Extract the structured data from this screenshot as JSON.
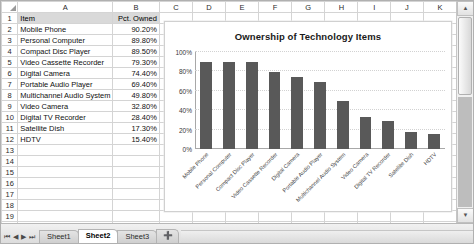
{
  "spreadsheet": {
    "column_headers": [
      "A",
      "B",
      "C",
      "D",
      "E",
      "F",
      "G",
      "H",
      "I",
      "J",
      "K"
    ],
    "row_numbers": [
      "1",
      "2",
      "3",
      "4",
      "5",
      "6",
      "7",
      "8",
      "9",
      "10",
      "11",
      "12",
      "13",
      "14",
      "15",
      "16",
      "17",
      "18",
      "19",
      "20"
    ],
    "header_row": {
      "item": "Item",
      "pct": "Pct. Owned"
    },
    "rows": [
      {
        "item": "Mobile Phone",
        "pct": "90.20%"
      },
      {
        "item": "Personal Computer",
        "pct": "89.80%"
      },
      {
        "item": "Compact Disc Player",
        "pct": "89.50%"
      },
      {
        "item": "Video Cassette Recorder",
        "pct": "79.30%"
      },
      {
        "item": "Digital Camera",
        "pct": "74.40%"
      },
      {
        "item": "Portable Audio Player",
        "pct": "69.40%"
      },
      {
        "item": "Multichannel Audio System",
        "pct": "49.80%"
      },
      {
        "item": "Video Camera",
        "pct": "32.80%"
      },
      {
        "item": "Digital TV Recorder",
        "pct": "28.40%"
      },
      {
        "item": "Satellite Dish",
        "pct": "17.30%"
      },
      {
        "item": "HDTV",
        "pct": "15.40%"
      }
    ]
  },
  "chart_data": {
    "type": "bar",
    "title": "Ownership of Technology Items",
    "xlabel": "",
    "ylabel": "",
    "categories": [
      "Mobile Phone",
      "Personal Computer",
      "Compact Disc Player",
      "Video Cassette Recorder",
      "Digital Camera",
      "Portable Audio Player",
      "Multichannel Audio System",
      "Video Camera",
      "Digital TV Recorder",
      "Satellite Dish",
      "HDTV"
    ],
    "values": [
      90.2,
      89.8,
      89.5,
      79.3,
      74.4,
      69.4,
      49.8,
      32.8,
      28.4,
      17.3,
      15.4
    ],
    "ytick_labels": [
      "100%",
      "80%",
      "60%",
      "40%",
      "20%",
      "0%"
    ],
    "ytick_values": [
      100,
      80,
      60,
      40,
      20,
      0
    ],
    "ylim": [
      0,
      100
    ],
    "grid": true,
    "legend": false,
    "bar_color": "#595959"
  },
  "sheet_tabs": {
    "tabs": [
      "Sheet1",
      "Sheet2",
      "Sheet3"
    ],
    "active": "Sheet2",
    "add_label": "➕",
    "nav": {
      "first": "⏮",
      "prev": "◀",
      "next": "▶",
      "last": "⏭"
    }
  },
  "scrollbars": {
    "v_up": "▲",
    "v_down": "▼",
    "h_left": "◀",
    "h_right": "▶"
  }
}
